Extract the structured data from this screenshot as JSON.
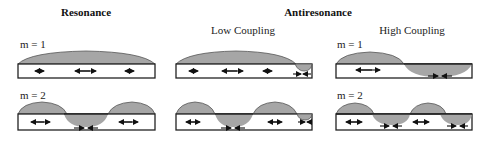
{
  "figure": {
    "headers": {
      "resonance": "Resonance",
      "antiresonance": "Antiresonance",
      "low_coupling": "Low Coupling",
      "high_coupling": "High Coupling"
    },
    "mode_labels": {
      "resonance_m1": "m = 1",
      "resonance_m2": "m = 2",
      "high_m1": "m = 1",
      "high_m2": "m = 2"
    },
    "colors": {
      "lobe_fill": "#a6a6a6",
      "outline": "#222222",
      "background": "#ffffff"
    },
    "panels": [
      {
        "id": "resonance",
        "m1_arrows": [
          "small-out",
          "long-double",
          "small-out"
        ],
        "m2_arrows": [
          "double",
          "inward-bottom",
          "double"
        ]
      },
      {
        "id": "low-coupling",
        "m1_arrows": [
          "small-out",
          "long-double",
          "small-out",
          "inward-edge"
        ],
        "m2_arrows": [
          "double",
          "inward-bottom",
          "double",
          "inward-edge"
        ]
      },
      {
        "id": "high-coupling",
        "m1_arrows": [
          "long-double",
          "inward-bottom"
        ],
        "m2_arrows": [
          "double",
          "inward-bottom",
          "double",
          "inward-bottom"
        ]
      }
    ]
  }
}
